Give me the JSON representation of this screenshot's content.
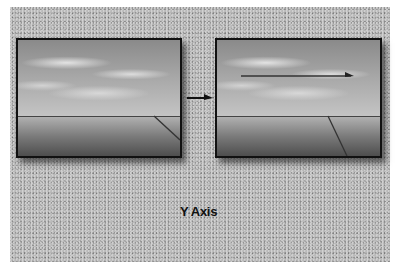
{
  "diagram": {
    "caption": "Y Axis",
    "frames": [
      {
        "id": "before",
        "description": "sky and ground scene with horizon line and diagonal line in lower right"
      },
      {
        "id": "after",
        "description": "same scene after yaw, with horizontal arrow across the sky and shifted diagonal line"
      }
    ],
    "connector": "arrow-right",
    "colors": {
      "background": "#b9b9b9",
      "frame_border": "#111111",
      "line": "#333333"
    }
  }
}
